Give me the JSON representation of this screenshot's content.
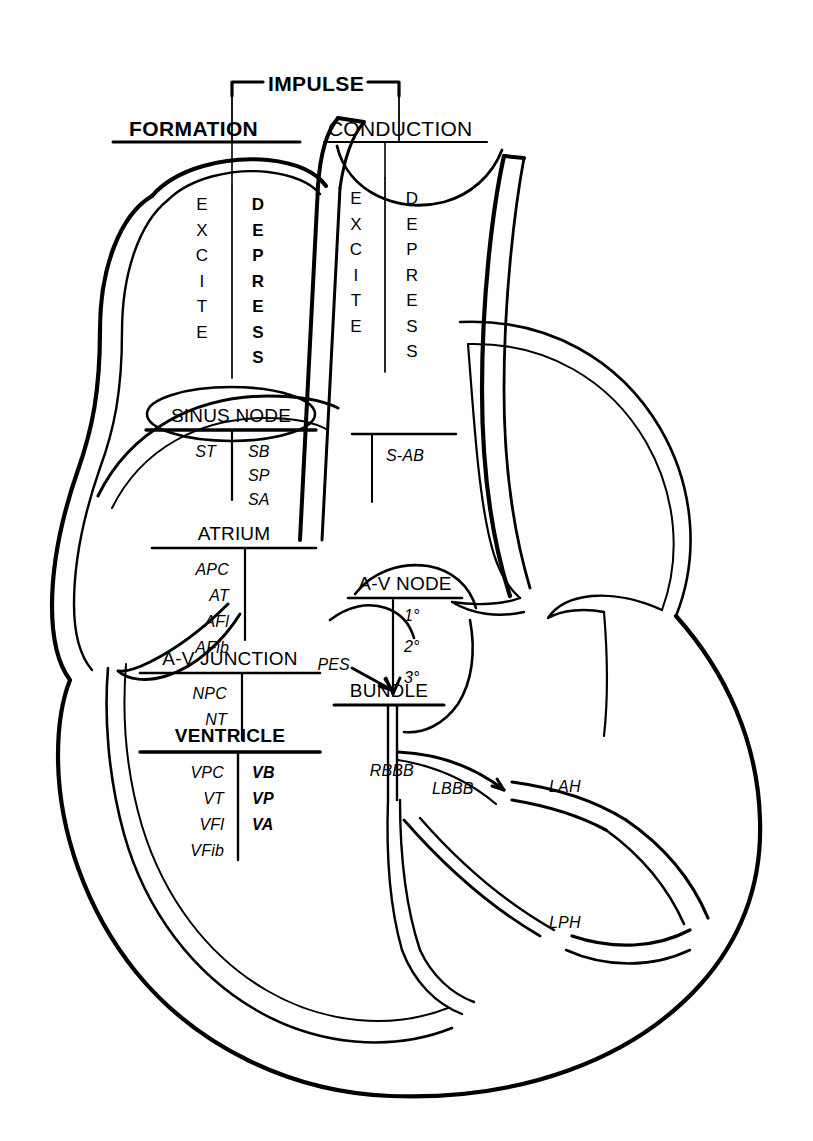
{
  "diagram": {
    "top_bracket_label": "IMPULSE",
    "headings": {
      "left": "FORMATION",
      "right": "CONDUCTION"
    },
    "columns": {
      "formation_excite": "EXCITE",
      "formation_depress": "DEPRESS",
      "conduction_excite": "EXCITE",
      "conduction_depress": "DEPRESS"
    },
    "formation_sections": [
      {
        "name": "sinus-node",
        "label": "SINUS NODE",
        "bold": false,
        "excite": [
          "ST"
        ],
        "depress": [
          "SB",
          "SP",
          "SA"
        ]
      },
      {
        "name": "atrium",
        "label": "ATRIUM",
        "bold": false,
        "excite": [
          "APC",
          "AT",
          "AFl",
          "AFib"
        ],
        "depress": []
      },
      {
        "name": "av-junction",
        "label": "A-V JUNCTION",
        "bold": false,
        "excite": [
          "NPC",
          "NT"
        ],
        "depress": []
      },
      {
        "name": "ventricle",
        "label": "VENTRICLE",
        "bold": true,
        "excite": [
          "VPC",
          "VT",
          "VFl",
          "VFib"
        ],
        "depress": [
          "VB",
          "VP",
          "VA"
        ]
      }
    ],
    "conduction_sections": [
      {
        "name": "sinoatrial-block",
        "label": "",
        "depress": [
          "S-AB"
        ]
      },
      {
        "name": "av-node",
        "label": "A-V NODE",
        "depress": [
          "1°",
          "2°",
          "3°"
        ]
      },
      {
        "name": "bundle",
        "label": "BUNDLE",
        "depress": [
          "RBBB",
          "LBBB"
        ]
      }
    ],
    "callouts": [
      {
        "name": "pes",
        "label": "PES"
      },
      {
        "name": "rbbb",
        "label": "RBBB"
      },
      {
        "name": "lbbb",
        "label": "LBBB"
      },
      {
        "name": "lah",
        "label": "LAH"
      },
      {
        "name": "lph",
        "label": "LPH"
      }
    ],
    "colors": {
      "ink": "#000000",
      "paper": "#ffffff"
    }
  }
}
